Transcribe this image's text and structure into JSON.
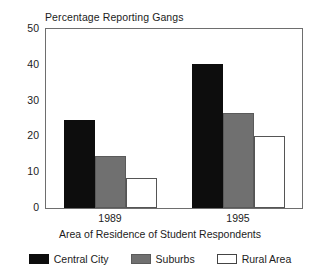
{
  "chart_data": {
    "type": "bar",
    "title": "Percentage Reporting Gangs",
    "xlabel": "Area of Residence of Student Respondents",
    "ylabel": "",
    "categories": [
      "1989",
      "1995"
    ],
    "series": [
      {
        "name": "Central City",
        "color": "#0d0d0d",
        "values": [
          24.6,
          40.3
        ]
      },
      {
        "name": "Suburbs",
        "color": "#707070",
        "values": [
          14.4,
          26.5
        ]
      },
      {
        "name": "Rural Area",
        "color": "#ffffff",
        "values": [
          8.3,
          20.2
        ]
      }
    ],
    "ylim": [
      0,
      50
    ],
    "yticks": [
      0,
      10,
      20,
      30,
      40,
      50
    ],
    "ytick_labels": [
      "0",
      "10",
      "20",
      "30",
      "40",
      "50"
    ],
    "grid": false,
    "legend_position": "bottom"
  },
  "legend": {
    "items": [
      {
        "label": "Central City",
        "swatch": "black-swatch"
      },
      {
        "label": "Suburbs",
        "swatch": "gray-swatch"
      },
      {
        "label": "Rural Area",
        "swatch": "white-swatch"
      }
    ]
  }
}
